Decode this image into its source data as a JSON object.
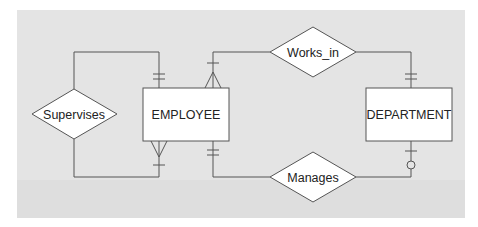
{
  "diagram": {
    "type": "ER diagram (crow's foot notation)",
    "background": "#e4e4e4",
    "line_color": "#555555",
    "entities": [
      {
        "id": "employee",
        "label": "EMPLOYEE"
      },
      {
        "id": "department",
        "label": "DEPARTMENT"
      }
    ],
    "relationships": [
      {
        "id": "supervises",
        "label": "Supervises",
        "from": "employee",
        "to": "employee",
        "cardinality": "one-to-many (recursive)"
      },
      {
        "id": "works_in",
        "label": "Works_in",
        "from": "employee",
        "to": "department",
        "cardinality": "many-to-one (mandatory)"
      },
      {
        "id": "manages",
        "label": "Manages",
        "from": "employee",
        "to": "department",
        "cardinality": "one-to-optional-one"
      }
    ]
  }
}
